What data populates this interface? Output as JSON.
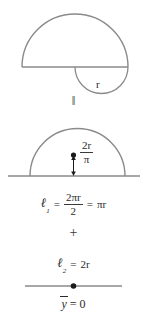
{
  "figure": {
    "stroke_color": "#8a8a8a",
    "text_color": "#2b2b2b",
    "background": "#ffffff"
  },
  "top_shape": {
    "name": "semicircle-with-lower-arc",
    "radius_label": "r"
  },
  "equivalence_symbol": "‖",
  "middle_shape": {
    "name": "semicircular-arc-with-centroid",
    "centroid_distance": {
      "numerator": "2r",
      "denominator": "π"
    }
  },
  "equation_l1": {
    "symbol": "ℓ",
    "subscript": "1",
    "equals_1": "=",
    "fraction": {
      "numerator": "2πr",
      "denominator": "2"
    },
    "equals_2": "=",
    "result": "πr"
  },
  "plus_symbol": "+",
  "equation_l2": {
    "symbol": "ℓ",
    "subscript": "2",
    "equals": "=",
    "value": "2r"
  },
  "bottom_shape": {
    "name": "straight-line-with-centroid"
  },
  "y_bar_result": {
    "variable": "y",
    "equals": "=",
    "value": "0"
  }
}
